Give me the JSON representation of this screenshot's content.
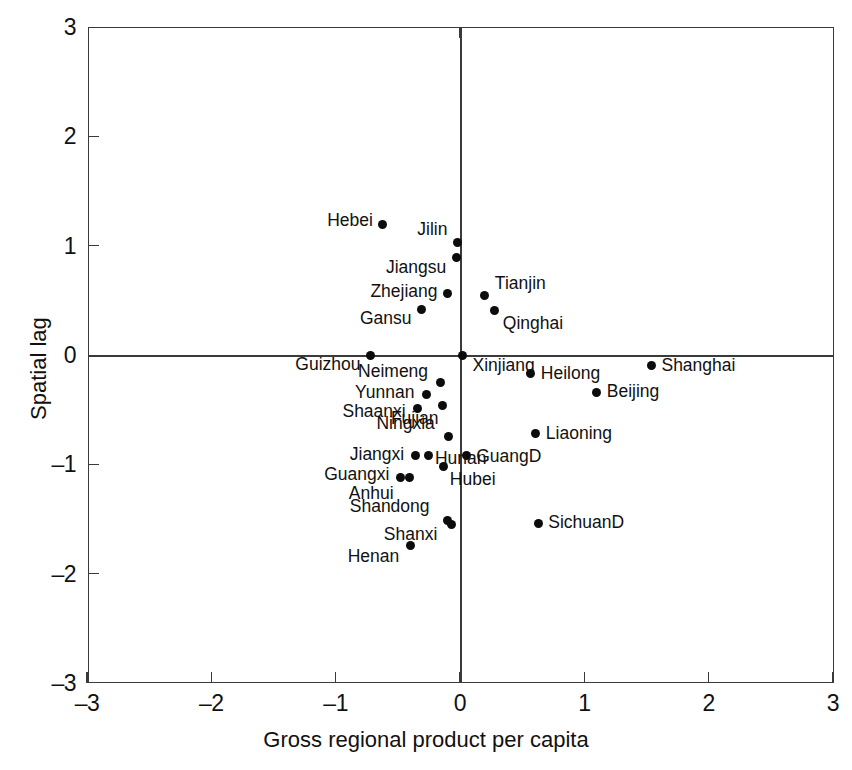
{
  "chart_data": {
    "type": "scatter",
    "title": "",
    "xlabel": "Gross regional product per capita",
    "ylabel": "Spatial lag",
    "xlim": [
      -3,
      3
    ],
    "ylim": [
      -3,
      3
    ],
    "xticks": [
      "-3",
      "-2",
      "-1",
      "0",
      "1",
      "2",
      "3"
    ],
    "yticks": [
      "3",
      "2",
      "1",
      "0",
      "-1",
      "-2",
      "-3"
    ],
    "grid": false,
    "legend": "none",
    "reference_lines": {
      "x": 0,
      "y": 0
    },
    "point_color": "#0c0c0c",
    "axis_color": "#3a3a3a",
    "points": [
      {
        "label": "Hebei",
        "x": -0.62,
        "y": 1.19,
        "anchor": "left"
      },
      {
        "label": "Jilin",
        "x": -0.02,
        "y": 1.03,
        "anchor": "left"
      },
      {
        "label": "Jiangsu",
        "x": -0.03,
        "y": 0.89,
        "anchor": "left-below"
      },
      {
        "label": "Zhejiang",
        "x": -0.1,
        "y": 0.56,
        "anchor": "left"
      },
      {
        "label": "Tianjin",
        "x": 0.2,
        "y": 0.54,
        "anchor": "right-above"
      },
      {
        "label": "Gansu",
        "x": -0.31,
        "y": 0.42,
        "anchor": "left-below"
      },
      {
        "label": "Qinghai",
        "x": 0.28,
        "y": 0.41,
        "anchor": "right-below"
      },
      {
        "label": "Guizhou",
        "x": -0.72,
        "y": 0.0,
        "anchor": "left-below"
      },
      {
        "label": "Xinjiang",
        "x": 0.02,
        "y": 0.0,
        "anchor": "right-below"
      },
      {
        "label": "Shanghai",
        "x": 1.54,
        "y": -0.1,
        "anchor": "right"
      },
      {
        "label": "Heilong",
        "x": 0.57,
        "y": -0.17,
        "anchor": "right"
      },
      {
        "label": "Neimeng",
        "x": -0.16,
        "y": -0.25,
        "anchor": "left-above"
      },
      {
        "label": "Beijing",
        "x": 1.1,
        "y": -0.34,
        "anchor": "right"
      },
      {
        "label": "Yunnan",
        "x": -0.27,
        "y": -0.36,
        "anchor": "left"
      },
      {
        "label": "Fujian",
        "x": -0.14,
        "y": -0.46,
        "anchor": "left-below"
      },
      {
        "label": "Shaanxi",
        "x": -0.34,
        "y": -0.49,
        "anchor": "left"
      },
      {
        "label": "Liaoning",
        "x": 0.61,
        "y": -0.72,
        "anchor": "right"
      },
      {
        "label": "Ningxia",
        "x": -0.09,
        "y": -0.75,
        "anchor": "left-above"
      },
      {
        "label": "Jiangxi",
        "x": -0.36,
        "y": -0.92,
        "anchor": "left"
      },
      {
        "label": "Hunan",
        "x": -0.25,
        "y": -0.92,
        "anchor": "right-nolabel"
      },
      {
        "label": "GuangD",
        "x": 0.05,
        "y": -0.92,
        "anchor": "right"
      },
      {
        "label": "Hubei",
        "x": -0.13,
        "y": -1.02,
        "anchor": "right-below"
      },
      {
        "label": "Guangxi",
        "x": -0.48,
        "y": -1.12,
        "anchor": "left"
      },
      {
        "label": "Anhui",
        "x": -0.41,
        "y": -1.12,
        "anchor": "below-nolabel"
      },
      {
        "label": "Shandong",
        "x": -0.1,
        "y": -1.51,
        "anchor": "left-above"
      },
      {
        "label": "Shanxi",
        "x": -0.07,
        "y": -1.55,
        "anchor": "left-below"
      },
      {
        "label": "SichuanD",
        "x": 0.63,
        "y": -1.54,
        "anchor": "right"
      },
      {
        "label": "Henan",
        "x": -0.4,
        "y": -1.74,
        "anchor": "left-below"
      }
    ]
  }
}
